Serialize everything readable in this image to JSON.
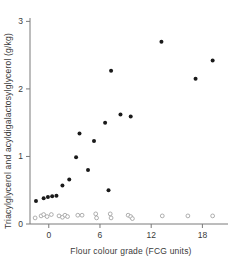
{
  "chart_data": {
    "type": "scatter",
    "title": "",
    "xlabel": "Flour colour grade (FCG units)",
    "ylabel": "Triacylglycerol and acyldigalactosylglycerol (g/kg)",
    "xlim": [
      -2.2,
      21.0
    ],
    "ylim": [
      0,
      3.05
    ],
    "xticks": [
      0,
      6,
      12,
      18
    ],
    "xtick_labels": [
      "0",
      "6",
      "12",
      "18"
    ],
    "yticks": [
      0,
      1,
      2,
      3
    ],
    "ytick_labels": [
      "0",
      "1",
      "2",
      "3"
    ],
    "grid": false,
    "legend": "none",
    "series": [
      {
        "name": "Triacylglycerol",
        "marker": "filled-circle",
        "color": "#1a1a1a",
        "points": [
          [
            -1.5,
            0.34
          ],
          [
            -0.6,
            0.38
          ],
          [
            -0.1,
            0.4
          ],
          [
            0.4,
            0.41
          ],
          [
            0.9,
            0.42
          ],
          [
            1.6,
            0.57
          ],
          [
            2.4,
            0.66
          ],
          [
            3.2,
            0.99
          ],
          [
            3.6,
            1.34
          ],
          [
            4.6,
            0.8
          ],
          [
            5.3,
            1.23
          ],
          [
            6.6,
            1.5
          ],
          [
            7.0,
            0.5
          ],
          [
            7.3,
            2.27
          ],
          [
            8.4,
            1.62
          ],
          [
            9.6,
            1.59
          ],
          [
            13.2,
            2.7
          ],
          [
            17.2,
            2.15
          ],
          [
            19.2,
            2.42
          ]
        ]
      },
      {
        "name": "Acyldigalactosylglycerol",
        "marker": "open-circle",
        "color": "#9a9a9a",
        "points": [
          [
            -1.6,
            0.09
          ],
          [
            -0.9,
            0.12
          ],
          [
            -0.6,
            0.14
          ],
          [
            -0.2,
            0.11
          ],
          [
            0.3,
            0.14
          ],
          [
            1.2,
            0.12
          ],
          [
            1.6,
            0.1
          ],
          [
            1.9,
            0.13
          ],
          [
            2.2,
            0.11
          ],
          [
            3.4,
            0.13
          ],
          [
            3.9,
            0.13
          ],
          [
            5.5,
            0.15
          ],
          [
            5.6,
            0.09
          ],
          [
            7.2,
            0.15
          ],
          [
            7.3,
            0.09
          ],
          [
            9.3,
            0.13
          ],
          [
            9.6,
            0.11
          ],
          [
            9.8,
            0.08
          ],
          [
            13.3,
            0.12
          ],
          [
            16.3,
            0.12
          ],
          [
            19.2,
            0.12
          ]
        ]
      }
    ]
  },
  "axes": {
    "x_title": "Flour colour grade (FCG units)",
    "y_title": "Triacylglycerol and acyldigalactosylglycerol (g/kg)"
  }
}
